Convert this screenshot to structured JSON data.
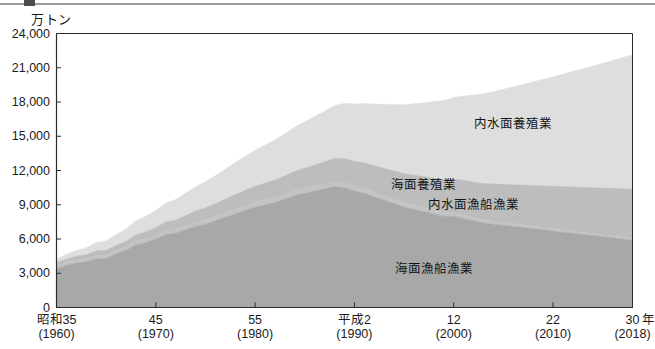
{
  "figure": {
    "unit_label": "万トン",
    "x_axis_unit": "年"
  },
  "chart_data": {
    "type": "area",
    "stacked": true,
    "title": "",
    "subtitle": "",
    "xlabel": "年",
    "ylabel": "万トン",
    "ylim": [
      0,
      24000
    ],
    "xlim": [
      1960,
      2018
    ],
    "grid": false,
    "legend_position": "inside-plot-right",
    "y_ticks": [
      "0",
      "3,000",
      "6,000",
      "9,000",
      "12,000",
      "15,000",
      "18,000",
      "21,000",
      "24,000"
    ],
    "y_tick_values": [
      0,
      3000,
      6000,
      9000,
      12000,
      15000,
      18000,
      21000,
      24000
    ],
    "x_ticks": [
      {
        "era": "昭和35",
        "year": "(1960)",
        "value": 1960
      },
      {
        "era": "45",
        "year": "(1970)",
        "value": 1970
      },
      {
        "era": "55",
        "year": "(1980)",
        "value": 1980
      },
      {
        "era": "平成2",
        "year": "(1990)",
        "value": 1990
      },
      {
        "era": "12",
        "year": "(2000)",
        "value": 2000
      },
      {
        "era": "22",
        "year": "(2010)",
        "value": 2010
      },
      {
        "era": "30",
        "year": "(2018)",
        "value": 2018
      }
    ],
    "x": [
      1960,
      1961,
      1962,
      1963,
      1964,
      1965,
      1966,
      1967,
      1968,
      1969,
      1970,
      1971,
      1972,
      1973,
      1974,
      1975,
      1976,
      1977,
      1978,
      1979,
      1980,
      1981,
      1982,
      1983,
      1984,
      1985,
      1986,
      1987,
      1988,
      1989,
      1990,
      1991,
      1992,
      1993,
      1994,
      1995,
      1996,
      1997,
      1998,
      1999,
      2000,
      2001,
      2002,
      2003,
      2004,
      2005,
      2006,
      2007,
      2008,
      2009,
      2010,
      2011,
      2012,
      2013,
      2014,
      2015,
      2016,
      2017,
      2018
    ],
    "series": [
      {
        "name": "海面漁船漁業",
        "color": "#a8a8a8",
        "label_x": 1998,
        "label_y": 3400,
        "values": [
          3400,
          3700,
          3900,
          4000,
          4300,
          4300,
          4700,
          5000,
          5500,
          5700,
          6000,
          6400,
          6500,
          6800,
          7100,
          7300,
          7600,
          7900,
          8200,
          8500,
          8800,
          9000,
          9200,
          9500,
          9800,
          10000,
          10200,
          10400,
          10600,
          10500,
          10200,
          10000,
          9700,
          9400,
          9100,
          8800,
          8600,
          8400,
          8200,
          8000,
          8000,
          7800,
          7600,
          7400,
          7300,
          7200,
          7100,
          7000,
          6900,
          6800,
          6700,
          6600,
          6500,
          6400,
          6300,
          6200,
          6100,
          6000,
          5900
        ]
      },
      {
        "name": "内水面漁船漁業",
        "color": "#c3c3c3",
        "label_x": 2002,
        "label_y": 9000,
        "values": [
          250,
          260,
          265,
          270,
          280,
          285,
          290,
          300,
          310,
          320,
          330,
          340,
          350,
          360,
          370,
          380,
          390,
          400,
          410,
          420,
          430,
          430,
          430,
          430,
          430,
          430,
          430,
          430,
          430,
          430,
          420,
          410,
          400,
          390,
          380,
          370,
          360,
          350,
          340,
          330,
          320,
          310,
          300,
          290,
          280,
          270,
          260,
          250,
          240,
          230,
          220,
          210,
          205,
          200,
          195,
          190,
          185,
          180,
          175
        ]
      },
      {
        "name": "海面養殖業",
        "color": "#bdbdbd",
        "label_x": 1997,
        "label_y": 10700,
        "values": [
          260,
          290,
          320,
          350,
          390,
          420,
          460,
          500,
          560,
          620,
          680,
          760,
          820,
          900,
          980,
          1050,
          1120,
          1200,
          1280,
          1340,
          1400,
          1470,
          1540,
          1620,
          1700,
          1780,
          1860,
          1940,
          2040,
          2130,
          2200,
          2260,
          2320,
          2400,
          2480,
          2560,
          2640,
          2720,
          2800,
          2880,
          2950,
          3030,
          3100,
          3180,
          3250,
          3320,
          3400,
          3470,
          3550,
          3620,
          3700,
          3780,
          3860,
          3930,
          4000,
          4080,
          4150,
          4230,
          4300
        ]
      },
      {
        "name": "内水面養殖業",
        "color": "#dedede",
        "label_x": 2006,
        "label_y": 16100,
        "values": [
          340,
          420,
          510,
          610,
          720,
          830,
          950,
          1080,
          1220,
          1360,
          1500,
          1650,
          1800,
          1960,
          2120,
          2280,
          2450,
          2620,
          2800,
          2980,
          3150,
          3330,
          3500,
          3680,
          3870,
          4050,
          4240,
          4430,
          4620,
          4820,
          5000,
          5200,
          5400,
          5610,
          5820,
          6030,
          6250,
          6470,
          6700,
          6920,
          7150,
          7380,
          7610,
          7850,
          8090,
          8330,
          8580,
          8830,
          9080,
          9340,
          9600,
          9860,
          10120,
          10390,
          10660,
          10930,
          11210,
          11490,
          11770
        ]
      }
    ]
  }
}
